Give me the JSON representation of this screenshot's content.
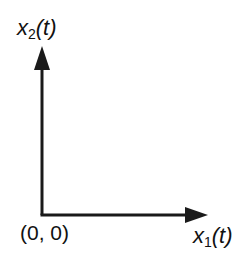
{
  "diagram": {
    "type": "coordinate-axes",
    "y_axis": {
      "variable": "x",
      "subscript": "2",
      "argument": "(t)",
      "label": "x2(t)"
    },
    "x_axis": {
      "variable": "x",
      "subscript": "1",
      "argument": "(t)",
      "label": "x1(t)"
    },
    "origin": {
      "label": "(0, 0)"
    },
    "colors": {
      "axis": "#1a1a1a",
      "text": "#111111",
      "background": "#ffffff"
    }
  }
}
